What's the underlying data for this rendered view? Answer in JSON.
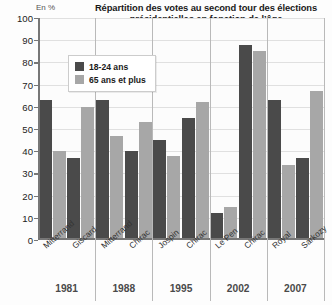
{
  "axis_unit_label": "En %",
  "legend": {
    "position": "inside-top-left",
    "entries": [
      {
        "label": "18-24 ans",
        "color": "#4a4a4a",
        "key": "young"
      },
      {
        "label": "65 ans et plus",
        "color": "#a7a7a7",
        "key": "old"
      }
    ]
  },
  "chart_data": {
    "type": "bar",
    "title": "Répartition des votes au second tour des élections présidentielles en fonction de l’âge",
    "title_lines": [
      "Répartition des votes au second tour des élections",
      "présidentielles en fonction de l’âge"
    ],
    "xlabel": "",
    "ylabel": "En %",
    "ylim": [
      0,
      100
    ],
    "yticks": [
      0,
      10,
      20,
      30,
      40,
      50,
      60,
      70,
      80,
      90,
      100
    ],
    "grid": true,
    "legend_position": "inside-top-left",
    "categories": [
      "Mitterrand",
      "Giscard",
      "Mitterrand",
      "Chirac",
      "Jospin",
      "Chirac",
      "Le Pen",
      "Chirac",
      "Royal",
      "Sarkozy"
    ],
    "groups": [
      {
        "year": "1981",
        "candidates": [
          "Mitterrand",
          "Giscard"
        ]
      },
      {
        "year": "1988",
        "candidates": [
          "Mitterrand",
          "Chirac"
        ]
      },
      {
        "year": "1995",
        "candidates": [
          "Jospin",
          "Chirac"
        ]
      },
      {
        "year": "2002",
        "candidates": [
          "Le Pen",
          "Chirac"
        ]
      },
      {
        "year": "2007",
        "candidates": [
          "Royal",
          "Sarkozy"
        ]
      }
    ],
    "series": [
      {
        "name": "18-24 ans",
        "color": "#4a4a4a",
        "values": [
          63,
          37,
          63,
          40,
          45,
          55,
          12,
          88,
          63,
          37
        ]
      },
      {
        "name": "65 ans et plus",
        "color": "#a7a7a7",
        "values": [
          40,
          60,
          47,
          53,
          38,
          62,
          15,
          85,
          34,
          67
        ]
      }
    ]
  }
}
